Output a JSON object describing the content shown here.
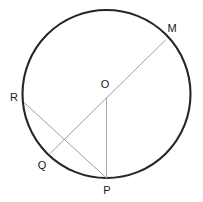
{
  "figure": {
    "type": "circle-geometry-diagram",
    "background_color": "#ffffff",
    "canvas": {
      "width": 203,
      "height": 202
    },
    "circle": {
      "label": "circle",
      "center_x": 106.5,
      "center_y": 94,
      "radius": 84,
      "stroke_color": "#262626",
      "stroke_width": 2.1,
      "fill": "none"
    },
    "points": [
      {
        "id": "M",
        "label": "M",
        "cx": 165.5,
        "cy": 40.0,
        "label_x": 172,
        "label_y": 28
      },
      {
        "id": "O",
        "label": "O",
        "cx": 106.5,
        "cy": 94.0,
        "label_x": 105,
        "label_y": 84
      },
      {
        "id": "R",
        "label": "R",
        "cx": 24.0,
        "cy": 102.5,
        "label_x": 14,
        "label_y": 97
      },
      {
        "id": "Q",
        "label": "Q",
        "cx": 50.0,
        "cy": 153.5,
        "label_x": 42,
        "label_y": 165
      },
      {
        "id": "P",
        "label": "P",
        "cx": 106.5,
        "cy": 178.0,
        "label_x": 107,
        "label_y": 190
      }
    ],
    "segments": [
      {
        "id": "QM",
        "label": "Q to M diameter",
        "from": "Q",
        "to": "M",
        "x1": 50.0,
        "y1": 153.5,
        "x2": 165.5,
        "y2": 40.0,
        "stroke_color": "#a0a0a0",
        "stroke_width": 1.0
      },
      {
        "id": "RP",
        "label": "R to P chord",
        "from": "R",
        "to": "P",
        "x1": 24.0,
        "y1": 102.5,
        "x2": 106.5,
        "y2": 178.0,
        "stroke_color": "#a0a0a0",
        "stroke_width": 1.0
      },
      {
        "id": "OP",
        "label": "O to P radius",
        "from": "O",
        "to": "P",
        "x1": 106.5,
        "y1": 97.0,
        "x2": 106.5,
        "y2": 178.0,
        "stroke_color": "#a8a8a8",
        "stroke_width": 1.0
      }
    ]
  }
}
